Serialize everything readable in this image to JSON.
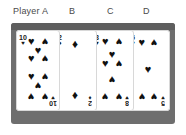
{
  "header": {
    "labels": [
      {
        "id": "a",
        "text": "Player A"
      },
      {
        "id": "b",
        "text": "B"
      },
      {
        "id": "c",
        "text": "C"
      },
      {
        "id": "d",
        "text": "D"
      }
    ]
  },
  "colors": {
    "frame": "#6e6e6e",
    "frame_top": "#5e5e5e",
    "surface": "#fdfdfd",
    "card_face": "#ffffff",
    "pip": "#111111",
    "label_text": "#4a4a4a"
  },
  "glyphs": {
    "heart": "♥",
    "diamond": "♦",
    "spade": "♠",
    "club": "♣"
  },
  "cards": [
    {
      "player": "A",
      "rank": "10",
      "suit": "heart",
      "suit_symbol": "♥",
      "pip_count": 10,
      "index_top": "10",
      "index_bottom": "10"
    },
    {
      "player": "B",
      "rank": "2",
      "suit": "diamond",
      "suit_symbol": "♦",
      "pip_count": 2,
      "index_top": "2",
      "index_bottom": "2"
    },
    {
      "player": "C",
      "rank": "8",
      "suit": "heart",
      "suit_symbol": "♥",
      "pip_count": 8,
      "index_top": "8",
      "index_bottom": "8"
    },
    {
      "player": "D",
      "rank": "5",
      "suit": "heart",
      "suit_symbol": "♥",
      "pip_count": 5,
      "index_top": "5",
      "index_bottom": "5"
    },
    {
      "player": "D2",
      "rank": "5",
      "suit": "heart",
      "suit_symbol": "♥",
      "pip_count": 5,
      "index_top": "5",
      "index_bottom": "5"
    }
  ]
}
